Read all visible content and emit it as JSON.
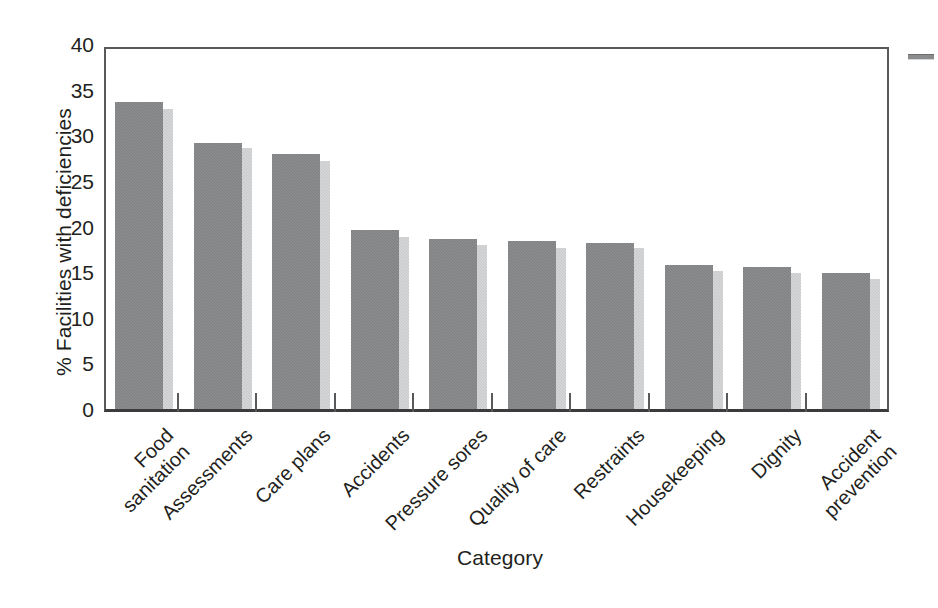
{
  "chart_data": {
    "type": "bar",
    "title": "",
    "xlabel": "Category",
    "ylabel": "% Facilities with deficiencies",
    "ylim": [
      0,
      40
    ],
    "yticks": [
      0,
      5,
      10,
      15,
      20,
      25,
      30,
      35,
      40
    ],
    "grid": false,
    "legend": "none-visible (cropped at right edge)",
    "orientation": "vertical",
    "categories": [
      "Food\nsanitation",
      "Assessments",
      "Care plans",
      "Accidents",
      "Pressure sores",
      "Quality of care",
      "Restraints",
      "Housekeeping",
      "Dignity",
      "Accident\nprevention"
    ],
    "series": [
      {
        "name": "Series 1",
        "color": "#7e7f81",
        "values": [
          33.7,
          29.2,
          27.9,
          19.6,
          18.6,
          18.4,
          18.2,
          15.8,
          15.6,
          14.9
        ]
      },
      {
        "name": "Series 2",
        "color": "#c7c8ca",
        "values": [
          32.9,
          28.6,
          27.2,
          18.8,
          18.0,
          17.7,
          17.6,
          15.1,
          14.9,
          14.2
        ]
      }
    ]
  },
  "axes": {
    "ylabel": "% Facilities with deficiencies",
    "xlabel": "Category",
    "ytick_labels": [
      "0",
      "5",
      "10",
      "15",
      "20",
      "25",
      "30",
      "35",
      "40"
    ]
  },
  "colors": {
    "series1": "#7e7f81",
    "series2": "#c7c8ca",
    "axis": "#58595b",
    "text": "#231f20",
    "background": "#ffffff"
  }
}
